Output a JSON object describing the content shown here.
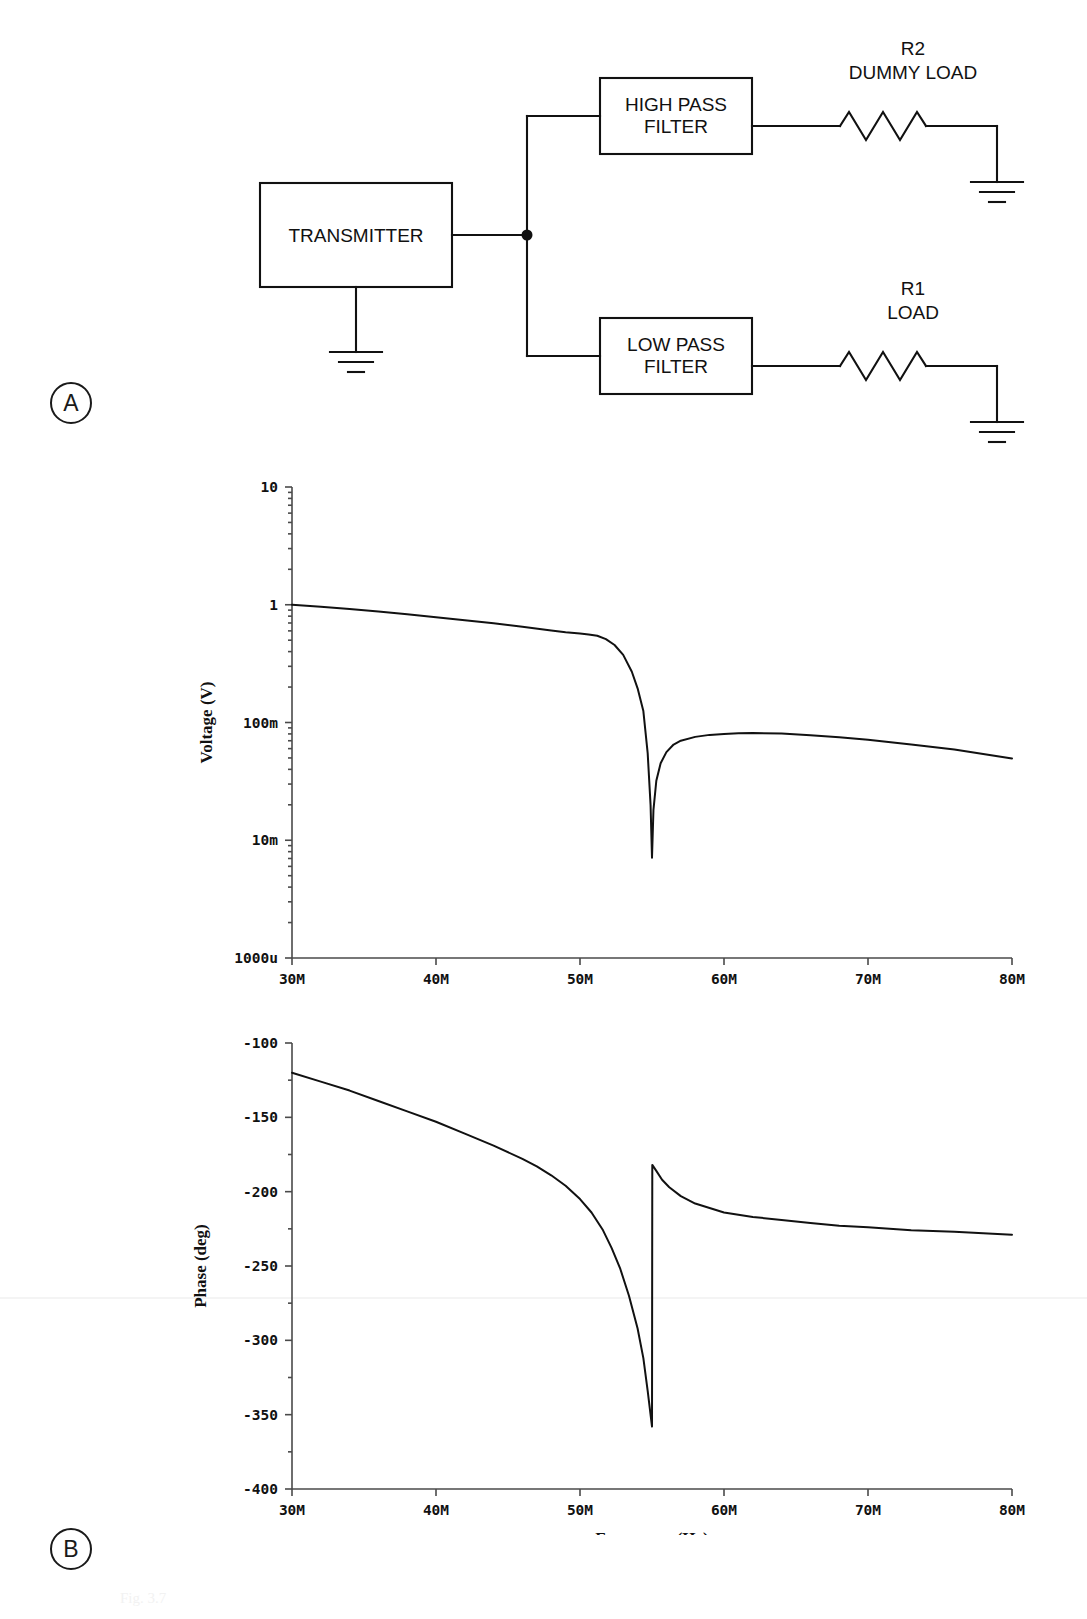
{
  "figure": {
    "panel_a_label": "A",
    "panel_b_label": "B",
    "caption": "Fig. 3.7"
  },
  "diagram": {
    "blocks": [
      {
        "id": "transmitter",
        "label": "TRANSMITTER"
      },
      {
        "id": "high-pass-filter",
        "label": "HIGH PASS\nFILTER"
      },
      {
        "id": "low-pass-filter",
        "label": "LOW PASS\nFILTER"
      }
    ],
    "components": [
      {
        "id": "r2",
        "designator": "R2",
        "name": "DUMMY LOAD"
      },
      {
        "id": "r1",
        "designator": "R1",
        "name": "LOAD"
      }
    ],
    "grounds": [
      "transmitter-ground",
      "r2-ground",
      "r1-ground"
    ],
    "junction": "signal-split-node"
  },
  "chart_data": [
    {
      "id": "voltage-magnitude",
      "type": "line",
      "title": "",
      "xlabel": "Frequency (Hz)",
      "ylabel": "Voltage (V)",
      "xscale": "linear",
      "yscale": "log",
      "xlim": [
        30000000,
        80000000
      ],
      "ylim": [
        0.001,
        10
      ],
      "xticks": [
        30000000,
        40000000,
        50000000,
        60000000,
        70000000,
        80000000
      ],
      "xticklabels": [
        "30M",
        "40M",
        "50M",
        "60M",
        "70M",
        "80M"
      ],
      "yticks": [
        10,
        1,
        0.1,
        0.01,
        0.001
      ],
      "yticklabels": [
        "10",
        "1",
        "100m",
        "10m",
        "1000u"
      ],
      "grid": false,
      "legend": "none",
      "series": [
        {
          "name": "Voltage",
          "x": [
            30.0,
            32.0,
            34.0,
            36.0,
            38.0,
            40.0,
            42.0,
            44.0,
            46.0,
            48.0,
            49.0,
            50.0,
            50.6,
            51.2,
            51.8,
            52.4,
            53.0,
            53.6,
            54.0,
            54.4,
            54.7,
            54.9,
            55.0,
            55.1,
            55.3,
            55.6,
            56.0,
            56.5,
            57.0,
            58.0,
            59.0,
            60.0,
            61.0,
            62.0,
            64.0,
            66.0,
            68.0,
            70.0,
            73.0,
            76.0,
            80.0
          ],
          "y": [
            1.0,
            0.96,
            0.92,
            0.875,
            0.83,
            0.785,
            0.74,
            0.695,
            0.65,
            0.605,
            0.585,
            0.57,
            0.56,
            0.545,
            0.51,
            0.455,
            0.375,
            0.27,
            0.195,
            0.125,
            0.055,
            0.02,
            0.0071,
            0.018,
            0.032,
            0.045,
            0.056,
            0.065,
            0.07,
            0.0755,
            0.0785,
            0.08,
            0.081,
            0.0815,
            0.0805,
            0.078,
            0.075,
            0.0715,
            0.065,
            0.059,
            0.0495
          ],
          "x_units": "MHz",
          "y_units": "V"
        }
      ],
      "notch": {
        "frequency": "55M",
        "min_voltage": "7m"
      }
    },
    {
      "id": "phase-response",
      "type": "line",
      "title": "",
      "xlabel": "Frequency (Hz)",
      "ylabel": "Phase (deg)",
      "xscale": "linear",
      "yscale": "linear",
      "xlim": [
        30000000,
        80000000
      ],
      "ylim": [
        -400,
        -100
      ],
      "xticks": [
        30000000,
        40000000,
        50000000,
        60000000,
        70000000,
        80000000
      ],
      "xticklabels": [
        "30M",
        "40M",
        "50M",
        "60M",
        "70M",
        "80M"
      ],
      "yticks": [
        -100,
        -150,
        -200,
        -250,
        -300,
        -350,
        -400
      ],
      "yticklabels": [
        "-100",
        "-150",
        "-200",
        "-250",
        "-300",
        "-350",
        "-400"
      ],
      "grid": false,
      "legend": "none",
      "series": [
        {
          "name": "Phase",
          "x": [
            30.0,
            32.0,
            34.0,
            36.0,
            38.0,
            40.0,
            42.0,
            44.0,
            46.0,
            47.0,
            48.0,
            49.0,
            50.0,
            50.8,
            51.6,
            52.2,
            52.8,
            53.4,
            54.0,
            54.4,
            54.7,
            54.9,
            55.0,
            55.02,
            55.3,
            55.7,
            56.2,
            57.0,
            58.0,
            59.0,
            60.0,
            62.0,
            64.0,
            66.0,
            68.0,
            70.0,
            73.0,
            76.0,
            80.0
          ],
          "y": [
            -120,
            -126,
            -132,
            -139,
            -146,
            -153,
            -161,
            -169,
            -178,
            -183,
            -189,
            -196,
            -205,
            -214,
            -226,
            -238,
            -252,
            -270,
            -292,
            -312,
            -334,
            -350,
            -358,
            -182,
            -186,
            -192,
            -197,
            -203,
            -208,
            -211,
            -214,
            -217,
            -219,
            -221,
            -223,
            -224,
            -226,
            -227,
            -229
          ],
          "x_units": "MHz",
          "y_units": "deg"
        }
      ],
      "discontinuity": {
        "frequency": "55M",
        "from_deg": -358,
        "to_deg": -182
      }
    }
  ]
}
